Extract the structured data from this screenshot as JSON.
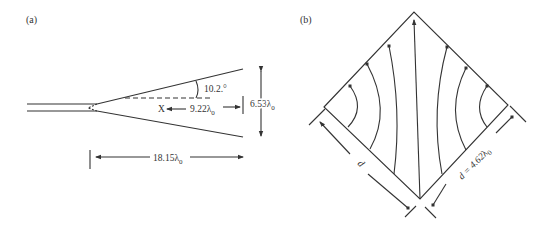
{
  "panel_a": {
    "label": "(a)",
    "angle_label": "10.2.°",
    "x_label": "X",
    "aperture_distance": "9.22",
    "aperture_width": "6.53",
    "horn_length": "18.15",
    "unit_symbol": "λ",
    "unit_subscript": "0"
  },
  "panel_b": {
    "label": "(b)",
    "side_label": "d",
    "side_value_prefix": "d = 4.62",
    "unit_symbol": "λ",
    "unit_subscript": "0"
  }
}
